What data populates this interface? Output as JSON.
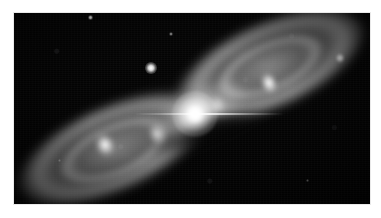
{
  "image": {
    "kind": "astronomical-photograph",
    "subject": "bipolar planetary nebula",
    "caption": "",
    "background_color": "#000000",
    "page_background_color": "#ffffff",
    "frame": {
      "x": 14,
      "y": 13,
      "width": 356,
      "height": 191
    }
  },
  "features": {
    "central_star": {
      "label": "central star",
      "x": 181,
      "y": 101,
      "color": "#ffffff"
    },
    "lobes": [
      {
        "label": "northeast lobe",
        "cx": 258,
        "cy": 52,
        "angle_deg": -24
      },
      {
        "label": "southwest lobe",
        "cx": 100,
        "cy": 136,
        "angle_deg": -24
      }
    ],
    "knots": [
      {
        "label": "northeast bright knot",
        "x": 255,
        "y": 70
      },
      {
        "label": "southwest bright knot",
        "x": 91,
        "y": 132
      },
      {
        "label": "southwest inner knot",
        "x": 143,
        "y": 121
      },
      {
        "label": "northeast inner knot",
        "x": 204,
        "y": 92
      }
    ],
    "field_stars": [
      {
        "label": "bright foreground star",
        "x": 137,
        "y": 55
      },
      {
        "label": "faint star upper left",
        "x": 76,
        "y": 4
      },
      {
        "label": "faint star upper middle",
        "x": 157,
        "y": 21
      },
      {
        "label": "faint star upper right",
        "x": 326,
        "y": 45
      },
      {
        "label": "faint star lower right",
        "x": 293,
        "y": 167
      },
      {
        "label": "faint star lower left",
        "x": 45,
        "y": 147
      }
    ],
    "dust_lane": {
      "label": "equatorial dust lane",
      "x": 192,
      "y": 119
    }
  },
  "palette": {
    "sky": "#030303",
    "nebula_core": "#ffffff",
    "nebula_mid": "#c8c8c8",
    "nebula_faint": "#6e6e6e",
    "frame_edge": "#e9e9e9"
  }
}
